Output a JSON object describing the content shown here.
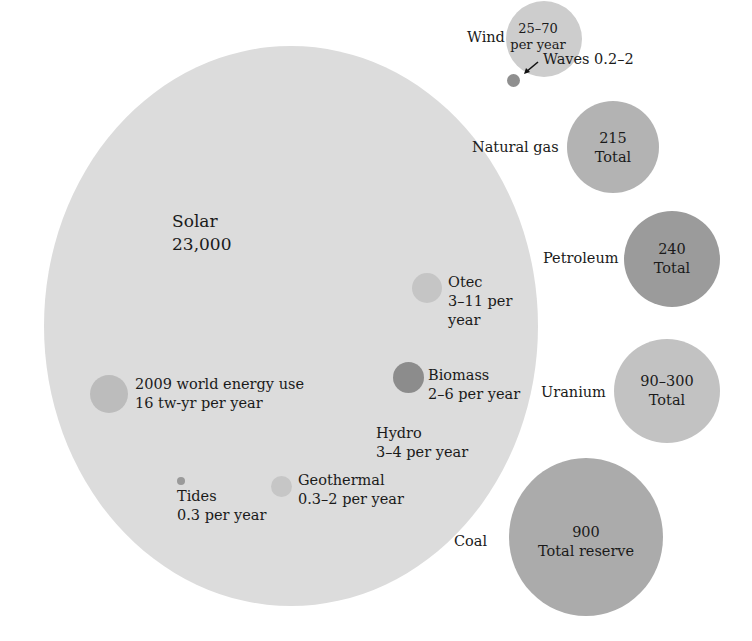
{
  "colors": {
    "background": "#ffffff",
    "solar": "#dcdcdc",
    "wind": "#cdcdcd",
    "waves": "#8f8f8f",
    "natural_gas": "#b3b3b3",
    "petroleum": "#9b9b9b",
    "uranium": "#c2c2c2",
    "coal": "#ababab",
    "otec": "#c5c5c5",
    "biomass": "#8c8c8c",
    "world_use": "#bcbcbc",
    "geothermal": "#c6c6c6",
    "tides": "#9a9a9a",
    "text": "#1a1a1a"
  },
  "renewable": {
    "solar": {
      "name": "Solar",
      "value": "23,000"
    },
    "wind": {
      "name": "Wind",
      "value_line1": "25–70",
      "value_line2": "per year"
    },
    "waves": {
      "label": "Waves 0.2–2"
    },
    "otec": {
      "name": "Otec",
      "line2": "3–11 per",
      "line3": "year"
    },
    "biomass": {
      "name": "Biomass",
      "line2": "2–6 per year"
    },
    "hydro": {
      "name": "Hydro",
      "line2": "3–4 per year"
    },
    "geothermal": {
      "name": "Geothermal",
      "line2": "0.3–2 per year"
    },
    "tides": {
      "name": "Tides",
      "line2": "0.3 per year"
    },
    "world_use": {
      "line1": "2009 world energy use",
      "line2": "16 tw-yr per year"
    }
  },
  "finite": {
    "natural_gas": {
      "name": "Natural gas",
      "value": "215",
      "unit": "Total"
    },
    "petroleum": {
      "name": "Petroleum",
      "value": "240",
      "unit": "Total"
    },
    "uranium": {
      "name": "Uranium",
      "value": "90–300",
      "unit": "Total"
    },
    "coal": {
      "name": "Coal",
      "value": "900",
      "unit": "Total reserve"
    }
  },
  "icons": {
    "waves_pointer": "arrow-down-left"
  }
}
